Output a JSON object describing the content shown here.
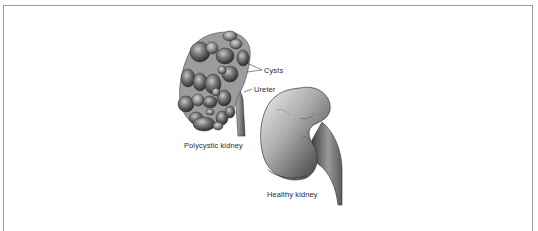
{
  "figure": {
    "labels": {
      "cysts": "Cysts",
      "ureter": "Ureter",
      "polycystic": "Polycystic kidney",
      "healthy": "Healthy kidney"
    },
    "colors": {
      "frame_border": "#9a9a9a",
      "kidney_dark": "#3a3a3a",
      "kidney_mid": "#7a7a7a",
      "kidney_light": "#d8d8d8",
      "label_text": "#2a2a2a"
    }
  }
}
